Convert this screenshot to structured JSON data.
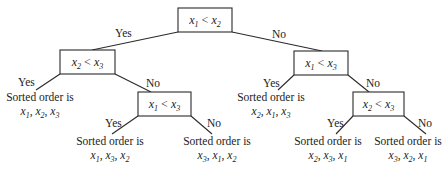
{
  "diagram": {
    "type": "decision-tree",
    "title": "",
    "nodes": {
      "root": {
        "text": "x1 < x2",
        "html": "x<tspan baseline-shift=\"sub\" font-size=\"8\">1</tspan> &lt; x<tspan baseline-shift=\"sub\" font-size=\"8\">2</tspan>"
      },
      "left": {
        "text": "x2 < x3"
      },
      "right": {
        "text": "x1 < x3"
      },
      "left_no": {
        "text": "x1 < x3"
      },
      "right_no": {
        "text": "x2 < x3"
      }
    },
    "edge_labels": {
      "yes": "Yes",
      "no": "No"
    },
    "leaves": [
      {
        "id": "leaf-1",
        "line1": "Sorted order is",
        "order": [
          "1",
          "2",
          "3"
        ],
        "text": "x1, x2, x3"
      },
      {
        "id": "leaf-2",
        "line1": "Sorted order is",
        "order": [
          "1",
          "3",
          "2"
        ],
        "text": "x1, x3, x2"
      },
      {
        "id": "leaf-3",
        "line1": "Sorted order is",
        "order": [
          "3",
          "1",
          "2"
        ],
        "text": "x3, x1, x2"
      },
      {
        "id": "leaf-4",
        "line1": "Sorted order is",
        "order": [
          "2",
          "1",
          "3"
        ],
        "text": "x2, x1, x3"
      },
      {
        "id": "leaf-5",
        "line1": "Sorted order is",
        "order": [
          "2",
          "3",
          "1"
        ],
        "text": "x2, x3, x1"
      },
      {
        "id": "leaf-6",
        "line1": "Sorted order is",
        "order": [
          "3",
          "2",
          "1"
        ],
        "text": "x3, x2, x1"
      }
    ],
    "colors": {
      "stroke": "#2a2a2a",
      "text": "#222222",
      "background": "#ffffff"
    }
  }
}
